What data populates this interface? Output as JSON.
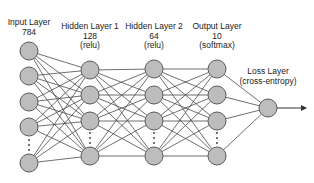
{
  "layers": [
    {
      "name": "Input Layer",
      "size": "784",
      "activation": "",
      "x": 29,
      "label_y": 18,
      "nodes": [
        51,
        76,
        102,
        127,
        163
      ],
      "dots_y": 145
    },
    {
      "name": "Hidden Layer 1",
      "size": "128",
      "activation": "(relu)",
      "x": 90,
      "label_y": 22,
      "nodes": [
        70,
        95,
        121,
        156
      ],
      "dots_y": 138
    },
    {
      "name": "Hidden Layer 2",
      "size": "64",
      "activation": "(relu)",
      "x": 154,
      "label_y": 22,
      "nodes": [
        69,
        95,
        121,
        156
      ],
      "dots_y": 138
    },
    {
      "name": "Output Layer",
      "size": "10",
      "activation": "(softmax)",
      "x": 217,
      "label_y": 22,
      "nodes": [
        69,
        95,
        121,
        156
      ],
      "dots_y": 138
    },
    {
      "name": "Loss Layer",
      "size": "",
      "activation": "(cross-entropy)",
      "x": 268,
      "label_y": 67,
      "nodes": [
        108
      ],
      "dots_y": null
    }
  ],
  "output_arrow": {
    "x1": 277,
    "y1": 108,
    "x2": 306,
    "y2": 108
  },
  "colors": {
    "node_fill": "#bdbdbd",
    "node_stroke": "#5a5a5a",
    "edge": "#4a4a4a"
  },
  "node_radius": 9
}
